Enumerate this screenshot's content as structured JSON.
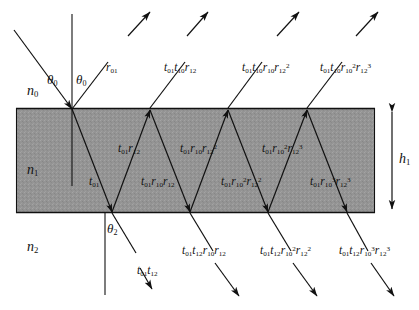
{
  "figure": {
    "film_color": "#949494",
    "line_color": "#111111",
    "background": "#ffffff"
  },
  "media": {
    "incident": "n",
    "incident_sub": "0",
    "film": "n",
    "film_sub": "1",
    "substrate": "n",
    "substrate_sub": "2"
  },
  "angles": {
    "theta0_left": "θ",
    "theta0_left_sub": "0",
    "theta0_right": "θ",
    "theta0_right_sub": "0",
    "theta2": "θ",
    "theta2_sub": "2"
  },
  "thickness": {
    "symbol": "h",
    "sub": "1"
  },
  "reflected_labels": [
    {
      "name": "reflected-order-0",
      "t": "r",
      "t_sub": "01",
      "full": "r01"
    },
    {
      "name": "reflected-order-1",
      "t": "t",
      "t_sub": "01",
      "full": "t01 t10 r12"
    },
    {
      "name": "reflected-order-2",
      "t": "t",
      "t_sub": "01",
      "full": "t01 t10 r10 r12^2"
    },
    {
      "name": "reflected-order-3",
      "t": "t",
      "t_sub": "01",
      "full": "t01 t10 r10^2 r12^3"
    }
  ],
  "film_upper_labels": [
    {
      "full": "t01 r12"
    },
    {
      "full": "t01 r10 r12^2"
    },
    {
      "full": "t01 r10^2 r12^3"
    }
  ],
  "film_lower_labels": [
    {
      "full": "t01"
    },
    {
      "full": "t01 r10 r12"
    },
    {
      "full": "t01 r10^2 r12^2"
    },
    {
      "full": "t01 r10^3 r12^3"
    }
  ],
  "transmitted_labels": [
    {
      "full": "t01 t12"
    },
    {
      "full": "t01 t12 r10 r12"
    },
    {
      "full": "t01 t12 r10^2 r12^2"
    },
    {
      "full": "t01 t12 r10^3 r12^3"
    }
  ]
}
